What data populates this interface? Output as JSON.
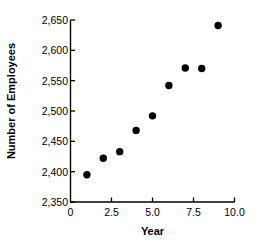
{
  "chart_data": {
    "type": "scatter",
    "title": "",
    "xlabel": "Year",
    "ylabel": "Number of Employees",
    "x": [
      1,
      2,
      3,
      4,
      5,
      6,
      7,
      8,
      9
    ],
    "values": [
      2395,
      2422,
      2433,
      2468,
      2492,
      2542,
      2571,
      2570,
      2641
    ],
    "series": [
      {
        "name": "Number of Employees",
        "points": [
          {
            "x": 1,
            "y": 2395
          },
          {
            "x": 2,
            "y": 2422
          },
          {
            "x": 3,
            "y": 2433
          },
          {
            "x": 4,
            "y": 2468
          },
          {
            "x": 5,
            "y": 2492
          },
          {
            "x": 6,
            "y": 2542
          },
          {
            "x": 7,
            "y": 2571
          },
          {
            "x": 8,
            "y": 2570
          },
          {
            "x": 9,
            "y": 2641
          }
        ]
      }
    ],
    "xlim": [
      0,
      10
    ],
    "ylim": [
      2350,
      2650
    ],
    "xticks": [
      0,
      2.5,
      5.0,
      7.5,
      10.0
    ],
    "xtick_labels": [
      "0",
      "2.5",
      "5.0",
      "7.5",
      "10.0"
    ],
    "yticks": [
      2350,
      2400,
      2450,
      2500,
      2550,
      2600,
      2650
    ],
    "ytick_labels": [
      "2,350",
      "2,400",
      "2,450",
      "2,500",
      "2,550",
      "2,600",
      "2,650"
    ],
    "grid": false,
    "legend": null,
    "marker": "filled-circle",
    "marker_color": "#000000",
    "axis_color": "#000000"
  }
}
